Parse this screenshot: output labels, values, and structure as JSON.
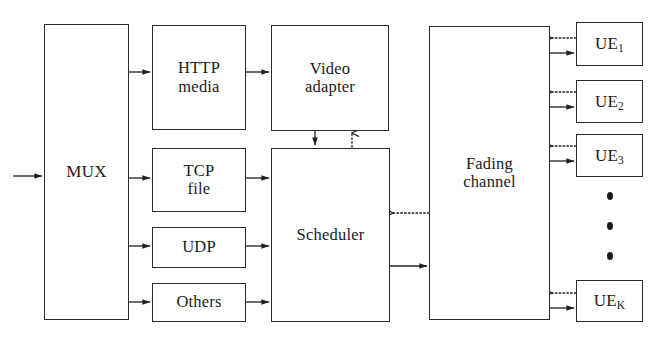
{
  "diagram": {
    "background_color": "#ffffff",
    "line_color": "#1f1f1f",
    "box_border_color": "#2b2b2b",
    "nodes": {
      "mux": {
        "label": "MUX"
      },
      "http_media": {
        "label": "HTTP\nmedia"
      },
      "tcp_file": {
        "label": "TCP\nfile"
      },
      "udp": {
        "label": "UDP"
      },
      "others": {
        "label": "Others"
      },
      "video_adapter": {
        "label": "Video\nadapter"
      },
      "scheduler": {
        "label": "Scheduler"
      },
      "fading_channel": {
        "label": "Fading\nchannel"
      },
      "ue_1": {
        "prefix": "UE",
        "subscript": "1"
      },
      "ue_2": {
        "prefix": "UE",
        "subscript": "2"
      },
      "ue_3": {
        "prefix": "UE",
        "subscript": "3"
      },
      "ue_k": {
        "prefix": "UE",
        "subscript": "K"
      }
    },
    "ellipsis": {
      "dot_count": 3
    },
    "edges": [
      {
        "name": "input-to-mux",
        "style": "solid"
      },
      {
        "name": "mux-to-http-media",
        "style": "solid"
      },
      {
        "name": "mux-to-tcp-file",
        "style": "solid"
      },
      {
        "name": "mux-to-udp",
        "style": "solid"
      },
      {
        "name": "mux-to-others",
        "style": "solid"
      },
      {
        "name": "http-media-to-video-adapter",
        "style": "solid"
      },
      {
        "name": "video-adapter-to-scheduler",
        "style": "solid"
      },
      {
        "name": "scheduler-to-video-adapter-feedback",
        "style": "dotted"
      },
      {
        "name": "tcp-file-to-scheduler",
        "style": "solid"
      },
      {
        "name": "udp-to-scheduler",
        "style": "solid"
      },
      {
        "name": "others-to-scheduler",
        "style": "solid"
      },
      {
        "name": "scheduler-to-fading-channel",
        "style": "solid"
      },
      {
        "name": "fading-channel-to-scheduler-feedback",
        "style": "dotted"
      },
      {
        "name": "fading-channel-to-ue-1",
        "style": "solid"
      },
      {
        "name": "ue-1-to-fading-channel-feedback",
        "style": "dotted"
      },
      {
        "name": "fading-channel-to-ue-2",
        "style": "solid"
      },
      {
        "name": "ue-2-to-fading-channel-feedback",
        "style": "dotted"
      },
      {
        "name": "fading-channel-to-ue-3",
        "style": "solid"
      },
      {
        "name": "ue-3-to-fading-channel-feedback",
        "style": "dotted"
      },
      {
        "name": "fading-channel-to-ue-k",
        "style": "solid"
      },
      {
        "name": "ue-k-to-fading-channel-feedback",
        "style": "dotted"
      }
    ]
  }
}
